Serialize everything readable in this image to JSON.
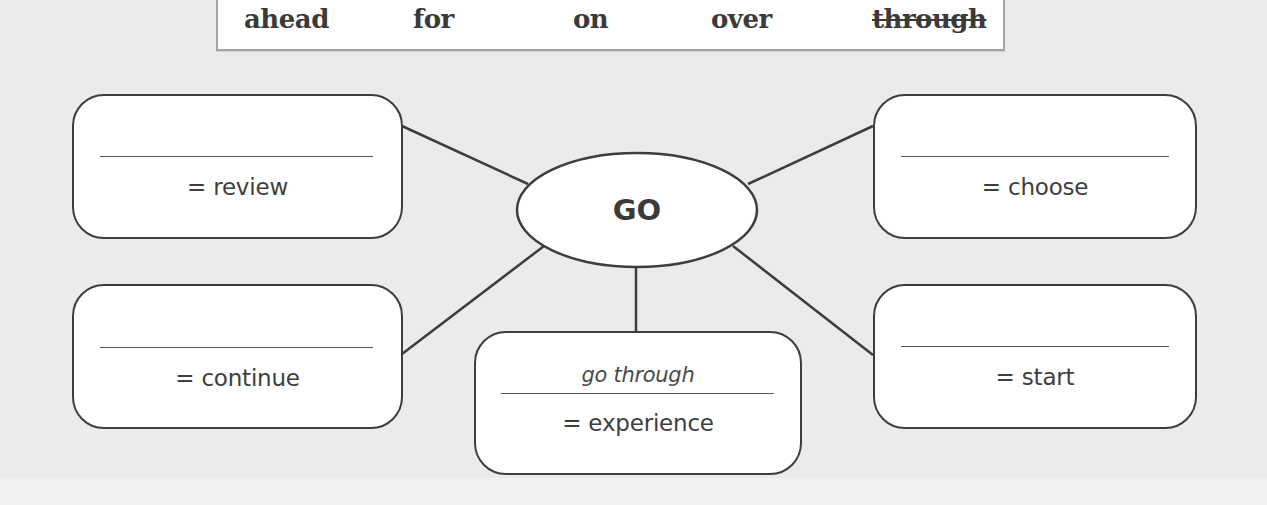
{
  "word_bank": {
    "words": [
      {
        "text": "ahead",
        "crossed_out": false
      },
      {
        "text": "for",
        "crossed_out": false
      },
      {
        "text": "on",
        "crossed_out": false
      },
      {
        "text": "over",
        "crossed_out": false
      },
      {
        "text": "through",
        "crossed_out": true
      }
    ]
  },
  "diagram": {
    "center": {
      "label": "GO"
    },
    "boxes": [
      {
        "position": "top-left",
        "answer": "",
        "meaning": "= review"
      },
      {
        "position": "bottom-left",
        "answer": "",
        "meaning": "= continue"
      },
      {
        "position": "bottom-center",
        "answer": "go through",
        "meaning": "= experience"
      },
      {
        "position": "top-right",
        "answer": "",
        "meaning": "= choose"
      },
      {
        "position": "bottom-right",
        "answer": "",
        "meaning": "= start"
      }
    ]
  },
  "colors": {
    "background": "#ebebeb",
    "box_fill": "#ffffff",
    "outline": "#3d3d3d",
    "word_box_border": "#a3a3a3"
  }
}
